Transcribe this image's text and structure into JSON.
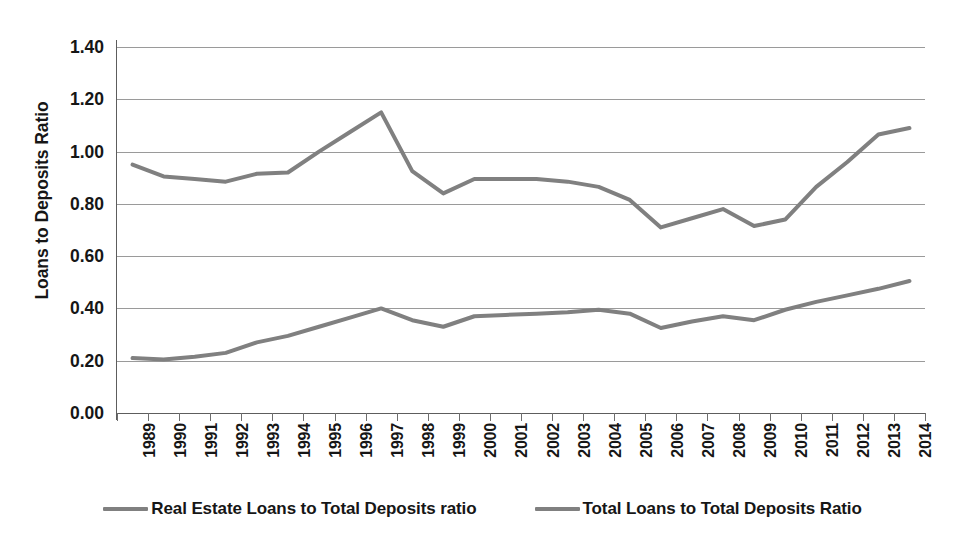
{
  "chart_data": {
    "type": "line",
    "title": "",
    "xlabel": "",
    "ylabel": "Loans to Deposits Ratio",
    "ylim": [
      0.0,
      1.4
    ],
    "ytick_step": 0.2,
    "ytick_labels": [
      "1.40",
      "1.20",
      "1.00",
      "0.80",
      "0.60",
      "0.40",
      "0.20",
      "0.00"
    ],
    "ytick_values": [
      1.4,
      1.2,
      1.0,
      0.8,
      0.6,
      0.4,
      0.2,
      0.0
    ],
    "grid": true,
    "legend_position": "bottom",
    "categories": [
      "1989",
      "1990",
      "1991",
      "1992",
      "1993",
      "1994",
      "1995",
      "1996",
      "1997",
      "1998",
      "1999",
      "2000",
      "2001",
      "2002",
      "2003",
      "2004",
      "2005",
      "2006",
      "2007",
      "2008",
      "2009",
      "2010",
      "2011",
      "2012",
      "2013",
      "2014"
    ],
    "series": [
      {
        "name": "Real Estate Loans to Total Deposits ratio",
        "color": "#808080",
        "values": [
          0.21,
          0.205,
          0.215,
          0.23,
          0.27,
          0.295,
          0.33,
          0.365,
          0.4,
          0.355,
          0.33,
          0.37,
          0.375,
          0.38,
          0.385,
          0.395,
          0.38,
          0.325,
          0.35,
          0.37,
          0.355,
          0.395,
          0.425,
          0.45,
          0.475,
          0.505
        ]
      },
      {
        "name": "Total Loans to Total Deposits Ratio",
        "color": "#808080",
        "values": [
          0.95,
          0.905,
          0.895,
          0.885,
          0.915,
          0.92,
          1.0,
          1.075,
          1.15,
          0.925,
          0.84,
          0.895,
          0.895,
          0.895,
          0.885,
          0.865,
          0.815,
          0.71,
          0.745,
          0.78,
          0.715,
          0.74,
          0.865,
          0.96,
          1.065,
          1.09
        ]
      }
    ]
  },
  "legend": {
    "entries": [
      {
        "label": "Real Estate Loans to Total Deposits ratio",
        "color": "#808080"
      },
      {
        "label": "Total Loans to Total Deposits Ratio",
        "color": "#808080"
      }
    ]
  },
  "colors": {
    "line": "#808080",
    "gridline": "#9a9a9a",
    "axis": "#5d5d5d",
    "text": "#161616",
    "background": "#ffffff"
  }
}
